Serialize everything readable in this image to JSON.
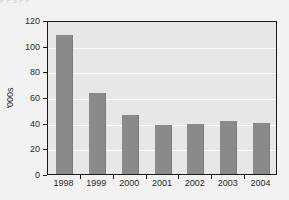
{
  "clipped_caption": "p   p       g                                  p    p",
  "chart_data": {
    "type": "bar",
    "title": "",
    "subtitle": "",
    "xlabel": "",
    "ylabel": "'000s",
    "categories": [
      "1998",
      "1999",
      "2000",
      "2001",
      "2002",
      "2003",
      "2004"
    ],
    "values": [
      108,
      63,
      46,
      38,
      39,
      41,
      40
    ],
    "series": [
      {
        "name": "",
        "values": [
          108,
          63,
          46,
          38,
          39,
          41,
          40
        ]
      }
    ],
    "ylim": [
      0,
      120
    ],
    "ytick_labels": [
      "0",
      "20",
      "40",
      "60",
      "80",
      "100",
      "120"
    ],
    "ytick_values": [
      0,
      20,
      40,
      60,
      80,
      100,
      120
    ],
    "grid": true,
    "grid_orientation": "horizontal",
    "legend": false,
    "legend_position": "none",
    "annotations": [],
    "colors": {
      "bar_fill": "#8a8a8a",
      "plot_background": "#e7e7e7",
      "figure_background": "#f2f2f2",
      "gridline": "#fbfbfb",
      "axis_line": "#1a1a1a",
      "tick_label": "#2b2b2b"
    }
  }
}
